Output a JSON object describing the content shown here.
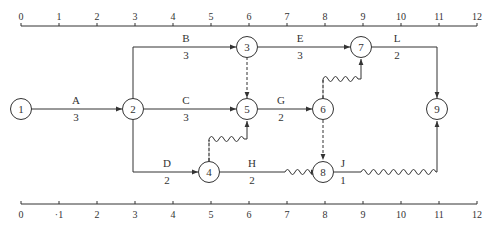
{
  "diagram": {
    "type": "time-scaled network (double-code) diagram",
    "axis": {
      "ticks": [
        "0",
        "1",
        "2",
        "3",
        "4",
        "5",
        "6",
        "7",
        "8",
        "9",
        "10",
        "11",
        "12"
      ],
      "bottom_ticks": [
        "0",
        "·1",
        "2",
        "3",
        "4",
        "5",
        "6",
        "7",
        "8",
        "9",
        "10",
        "11",
        "12"
      ]
    },
    "nodes": [
      {
        "id": "1",
        "label": "1",
        "t": 0,
        "row": "middle"
      },
      {
        "id": "2",
        "label": "2",
        "t": 3,
        "row": "middle"
      },
      {
        "id": "3",
        "label": "3",
        "t": 6,
        "row": "top"
      },
      {
        "id": "4",
        "label": "4",
        "t": 5,
        "row": "bottom"
      },
      {
        "id": "5",
        "label": "5",
        "t": 6,
        "row": "middle"
      },
      {
        "id": "6",
        "label": "6",
        "t": 8,
        "row": "middle"
      },
      {
        "id": "7",
        "label": "7",
        "t": 9,
        "row": "top"
      },
      {
        "id": "8",
        "label": "8",
        "t": 8,
        "row": "bottom"
      },
      {
        "id": "9",
        "label": "9",
        "t": 11,
        "row": "middle"
      }
    ],
    "activities": [
      {
        "name": "A",
        "duration": "3",
        "from": "1",
        "to": "2"
      },
      {
        "name": "B",
        "duration": "3",
        "from": "2",
        "to": "3"
      },
      {
        "name": "C",
        "duration": "3",
        "from": "2",
        "to": "5"
      },
      {
        "name": "D",
        "duration": "2",
        "from": "2",
        "to": "4"
      },
      {
        "name": "E",
        "duration": "3",
        "from": "3",
        "to": "7"
      },
      {
        "name": "G",
        "duration": "2",
        "from": "5",
        "to": "6"
      },
      {
        "name": "H",
        "duration": "2",
        "from": "4",
        "to": "8",
        "free_float": 1
      },
      {
        "name": "J",
        "duration": "1",
        "from": "8",
        "to": "9",
        "free_float": 2
      },
      {
        "name": "L",
        "duration": "2",
        "from": "7",
        "to": "9"
      }
    ],
    "dummies": [
      {
        "from": "3",
        "to": "5"
      },
      {
        "from": "4",
        "to": "5",
        "float": 1
      },
      {
        "from": "6",
        "to": "7",
        "float": 1
      },
      {
        "from": "6",
        "to": "8"
      }
    ]
  }
}
